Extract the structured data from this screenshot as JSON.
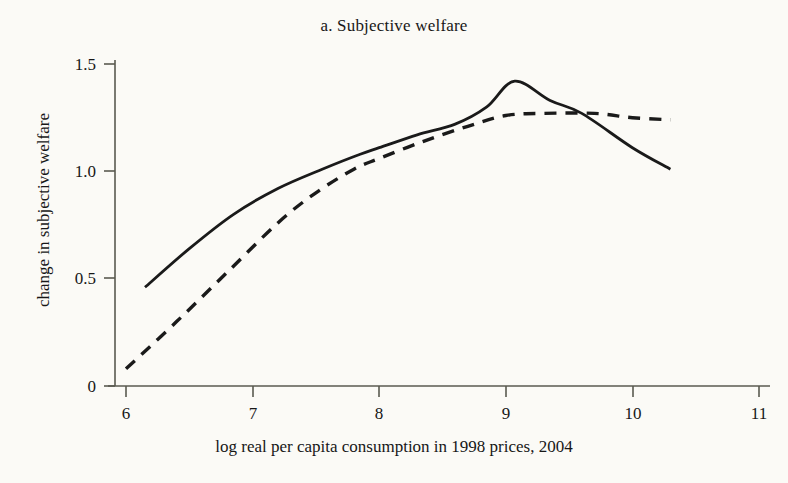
{
  "chart_data": {
    "type": "line",
    "title": "a. Subjective welfare",
    "xlabel": "log real per capita consumption in 1998 prices, 2004",
    "ylabel": "change in subjective welfare",
    "xlim": [
      6,
      11
    ],
    "ylim": [
      0,
      1.5
    ],
    "xticks": [
      "6",
      "7",
      "8",
      "9",
      "10",
      "11"
    ],
    "yticks": [
      "0",
      "0.5",
      "1.0",
      "1.5"
    ],
    "grid": false,
    "legend": "none",
    "series": [
      {
        "name": "solid",
        "style": "solid",
        "color": "#1a1a1a",
        "points": [
          {
            "x": 6.15,
            "y": 0.46
          },
          {
            "x": 6.5,
            "y": 0.64
          },
          {
            "x": 6.85,
            "y": 0.8
          },
          {
            "x": 7.2,
            "y": 0.92
          },
          {
            "x": 7.55,
            "y": 1.01
          },
          {
            "x": 7.85,
            "y": 1.08
          },
          {
            "x": 8.0,
            "y": 1.11
          },
          {
            "x": 8.3,
            "y": 1.17
          },
          {
            "x": 8.6,
            "y": 1.22
          },
          {
            "x": 8.85,
            "y": 1.3
          },
          {
            "x": 9.07,
            "y": 1.42
          },
          {
            "x": 9.35,
            "y": 1.33
          },
          {
            "x": 9.6,
            "y": 1.27
          },
          {
            "x": 10.0,
            "y": 1.11
          },
          {
            "x": 10.3,
            "y": 1.01
          }
        ]
      },
      {
        "name": "dashed",
        "style": "dashed",
        "color": "#1a1a1a",
        "points": [
          {
            "x": 6.0,
            "y": 0.08
          },
          {
            "x": 6.4,
            "y": 0.3
          },
          {
            "x": 6.8,
            "y": 0.53
          },
          {
            "x": 7.2,
            "y": 0.76
          },
          {
            "x": 7.5,
            "y": 0.9
          },
          {
            "x": 7.8,
            "y": 1.01
          },
          {
            "x": 8.0,
            "y": 1.06
          },
          {
            "x": 8.35,
            "y": 1.14
          },
          {
            "x": 8.7,
            "y": 1.21
          },
          {
            "x": 9.0,
            "y": 1.26
          },
          {
            "x": 9.3,
            "y": 1.27
          },
          {
            "x": 9.7,
            "y": 1.27
          },
          {
            "x": 10.0,
            "y": 1.25
          },
          {
            "x": 10.3,
            "y": 1.24
          }
        ]
      }
    ]
  },
  "axes": {
    "y_tick_labels": [
      "1.5",
      "1.0",
      "0.5",
      "0"
    ],
    "x_tick_labels": [
      "6",
      "7",
      "8",
      "9",
      "10",
      "11"
    ]
  }
}
